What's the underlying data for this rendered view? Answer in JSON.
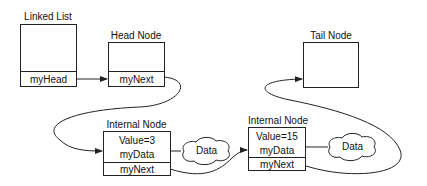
{
  "diagram": {
    "linked_list": {
      "title": "Linked List",
      "field": "myHead"
    },
    "head_node": {
      "title": "Head Node",
      "field": "myNext"
    },
    "tail_node": {
      "title": "Tail Node"
    },
    "internal_nodes": [
      {
        "title": "Internal Node",
        "value": "Value=3",
        "data_field": "myData",
        "next_field": "myNext",
        "cloud": "Data"
      },
      {
        "title": "Internal Node",
        "value": "Value=15",
        "data_field": "myData",
        "next_field": "myNext",
        "cloud": "Data"
      }
    ],
    "colors": {
      "stroke": "#222222",
      "background": "#ffffff"
    }
  }
}
